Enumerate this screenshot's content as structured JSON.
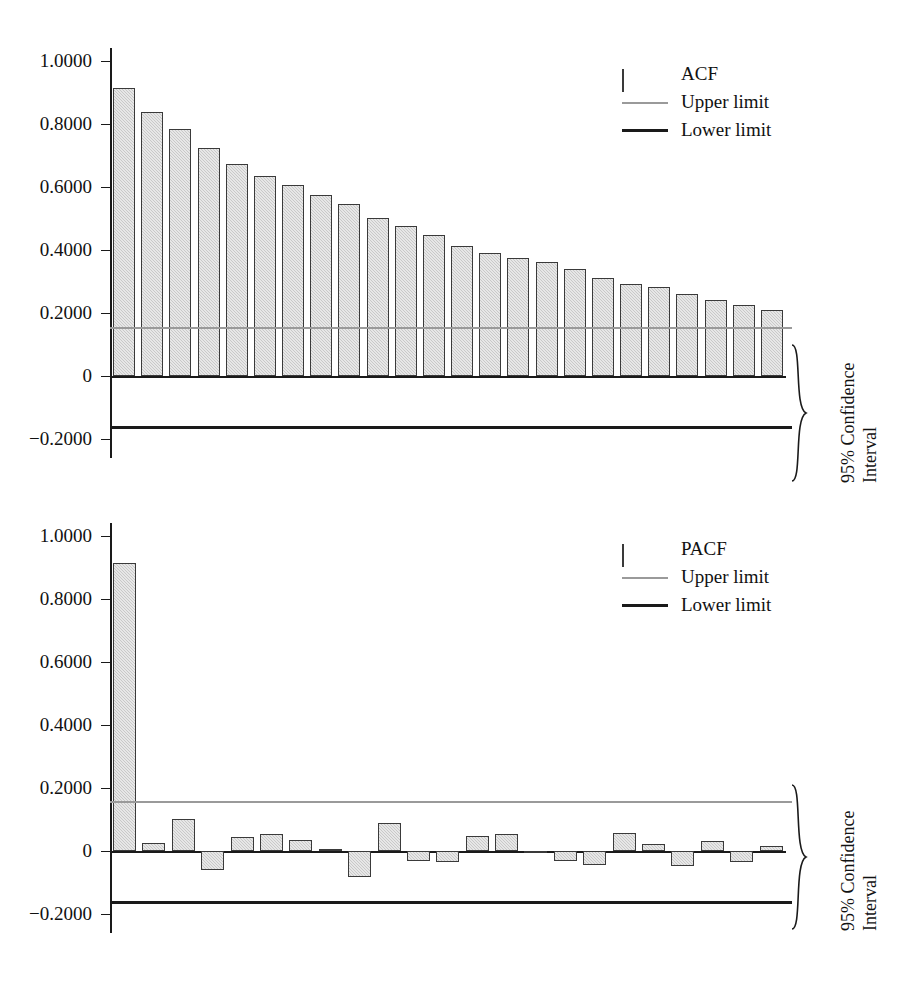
{
  "figure": {
    "faint_header": "",
    "bar_fill": "#c9c9c9",
    "bar_border": "#3a3a3a",
    "upper_limit_color": "#9a9a9a",
    "lower_limit_color": "#1a1a1a"
  },
  "panels": [
    {
      "id": "acf",
      "legend": [
        {
          "key": "swatch",
          "label": "ACF"
        },
        {
          "key": "line-upper",
          "label": "Upper limit"
        },
        {
          "key": "line-lower",
          "label": "Lower limit"
        }
      ],
      "annotation": {
        "line1": "95% Confidence",
        "line2": "Interval"
      },
      "ytick_labels": [
        "1.0000",
        "0.8000",
        "0.6000",
        "0.4000",
        "0.2000",
        "0",
        "−0.2000"
      ]
    },
    {
      "id": "pacf",
      "legend": [
        {
          "key": "swatch",
          "label": "PACF"
        },
        {
          "key": "line-upper",
          "label": "Upper limit"
        },
        {
          "key": "line-lower",
          "label": "Lower limit"
        }
      ],
      "annotation": {
        "line1": "95% Confidence",
        "line2": "Interval"
      },
      "ytick_labels": [
        "1.0000",
        "0.8000",
        "0.6000",
        "0.4000",
        "0.2000",
        "0",
        "−0.2000"
      ]
    }
  ],
  "chart_data": [
    {
      "type": "bar",
      "title": "",
      "series_name": "ACF",
      "xlabel": "",
      "ylabel": "",
      "ylim": [
        -0.26,
        1.04
      ],
      "yticks": [
        1.0,
        0.8,
        0.6,
        0.4,
        0.2,
        0,
        -0.2
      ],
      "ytick_labels": [
        "1.0000",
        "0.8000",
        "0.6000",
        "0.4000",
        "0.2000",
        "0",
        "−0.2000"
      ],
      "grid": false,
      "legend_position": "top-right",
      "categories": [
        1,
        2,
        3,
        4,
        5,
        6,
        7,
        8,
        9,
        10,
        11,
        12,
        13,
        14,
        15,
        16,
        17,
        18,
        19,
        20,
        21,
        22,
        23,
        24,
        25,
        26,
        27,
        28
      ],
      "values": [
        0.912,
        0.838,
        0.784,
        0.722,
        0.672,
        0.635,
        0.605,
        0.574,
        0.546,
        0.502,
        0.476,
        0.448,
        0.413,
        0.389,
        0.374,
        0.36,
        0.338,
        0.311,
        0.293,
        0.281,
        0.259,
        0.24,
        0.226,
        0.208,
        0.0,
        0.0,
        0.0,
        0.0
      ],
      "n_bars": 24,
      "lines": [
        {
          "name": "Upper limit",
          "value": 0.155,
          "color": "#9a9a9a"
        },
        {
          "name": "Lower limit",
          "value": -0.157,
          "color": "#1a1a1a"
        }
      ],
      "annotations": [
        {
          "text": "95% Confidence Interval",
          "from": -0.157,
          "to": 0.155,
          "orientation": "vertical-right"
        }
      ]
    },
    {
      "type": "bar",
      "title": "",
      "series_name": "PACF",
      "xlabel": "",
      "ylabel": "",
      "ylim": [
        -0.26,
        1.04
      ],
      "yticks": [
        1.0,
        0.8,
        0.6,
        0.4,
        0.2,
        0,
        -0.2
      ],
      "ytick_labels": [
        "1.0000",
        "0.8000",
        "0.6000",
        "0.4000",
        "0.2000",
        "0",
        "−0.2000"
      ],
      "grid": false,
      "legend_position": "top-right",
      "categories": [
        1,
        2,
        3,
        4,
        5,
        6,
        7,
        8,
        9,
        10,
        11,
        12,
        13,
        14,
        15,
        16,
        17,
        18,
        19,
        20,
        21,
        22,
        23,
        24
      ],
      "values": [
        0.912,
        0.026,
        0.103,
        -0.06,
        0.043,
        0.054,
        0.036,
        0.005,
        -0.083,
        0.09,
        -0.033,
        -0.035,
        0.046,
        0.055,
        -0.004,
        -0.031,
        -0.044,
        0.057,
        0.023,
        -0.048,
        0.032,
        -0.035,
        0.016,
        0.0
      ],
      "n_bars": 23,
      "lines": [
        {
          "name": "Upper limit",
          "value": 0.16,
          "color": "#9a9a9a"
        },
        {
          "name": "Lower limit",
          "value": -0.157,
          "color": "#1a1a1a"
        }
      ],
      "annotations": [
        {
          "text": "95% Confidence Interval",
          "from": -0.157,
          "to": 0.16,
          "orientation": "vertical-right"
        }
      ]
    }
  ]
}
